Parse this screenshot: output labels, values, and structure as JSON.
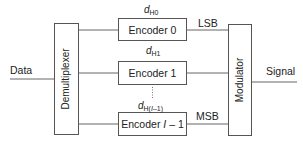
{
  "diagram": {
    "input_label": "Data",
    "output_label": "Signal",
    "demultiplexer": {
      "label": "Demultiplexer"
    },
    "modulator": {
      "label": "Modulator"
    },
    "encoders": [
      {
        "label_prefix": "Encoder ",
        "label_index": "0",
        "label_suffix": "",
        "symbol_base": "d",
        "symbol_sub": "H0",
        "side_label": "LSB"
      },
      {
        "label_prefix": "Encoder ",
        "label_index": "1",
        "label_suffix": "",
        "symbol_base": "d",
        "symbol_sub": "H1",
        "side_label": ""
      },
      {
        "label_prefix": "Encoder ",
        "label_index": "I",
        "label_suffix": " – 1",
        "symbol_base": "d",
        "symbol_sub_prefix": "H(",
        "symbol_sub_var": "I",
        "symbol_sub_suffix": "–1)",
        "side_label": "MSB"
      }
    ],
    "colors": {
      "stroke": "#555555",
      "text": "#222222",
      "background": "#ffffff"
    }
  }
}
